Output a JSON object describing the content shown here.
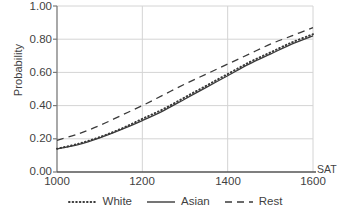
{
  "chart_data": {
    "type": "line",
    "title": "",
    "subtitle": "",
    "xlabel": "SAT",
    "ylabel": "Probability",
    "xlim": [
      1000,
      1600
    ],
    "ylim": [
      0.0,
      1.0
    ],
    "grid": true,
    "legend_position": "bottom-center",
    "x_ticks": [
      "1000",
      "1200",
      "1400",
      "1600"
    ],
    "x_tick_values": [
      1000,
      1200,
      1400,
      1600
    ],
    "y_ticks": [
      "0.00",
      "0.20",
      "0.40",
      "0.60",
      "0.80",
      "1.00"
    ],
    "y_tick_values": [
      0.0,
      0.2,
      0.4,
      0.6,
      0.8,
      1.0
    ],
    "x": [
      1000,
      1050,
      1100,
      1150,
      1200,
      1250,
      1300,
      1350,
      1400,
      1450,
      1500,
      1550,
      1600
    ],
    "series": [
      {
        "name": "White",
        "style": "dotted",
        "color": "#3a3a3a",
        "values": [
          0.14,
          0.17,
          0.21,
          0.26,
          0.32,
          0.38,
          0.45,
          0.52,
          0.59,
          0.66,
          0.72,
          0.78,
          0.83
        ]
      },
      {
        "name": "Asian",
        "style": "solid",
        "color": "#3a3a3a",
        "values": [
          0.14,
          0.165,
          0.205,
          0.255,
          0.31,
          0.37,
          0.44,
          0.51,
          0.58,
          0.65,
          0.71,
          0.77,
          0.82
        ]
      },
      {
        "name": "Rest",
        "style": "dashed",
        "color": "#3a3a3a",
        "values": [
          0.19,
          0.23,
          0.28,
          0.34,
          0.4,
          0.465,
          0.53,
          0.59,
          0.65,
          0.71,
          0.77,
          0.82,
          0.87
        ]
      }
    ]
  },
  "axes": {
    "y_title": "Probability",
    "x_title": "SAT",
    "y_labels": [
      "1.00",
      "0.80",
      "0.60",
      "0.40",
      "0.20",
      "0.00"
    ],
    "x_labels": [
      "1000",
      "1200",
      "1400",
      "1600"
    ]
  },
  "legend": {
    "items": [
      {
        "label": "White",
        "style": "dotted"
      },
      {
        "label": "Asian",
        "style": "solid"
      },
      {
        "label": "Rest",
        "style": "dashed"
      }
    ]
  },
  "colors": {
    "line": "#3a3a3a",
    "grid": "#d4d4d4",
    "axis": "#7a7a7a",
    "text": "#3f3f3f",
    "background": "#ffffff"
  }
}
